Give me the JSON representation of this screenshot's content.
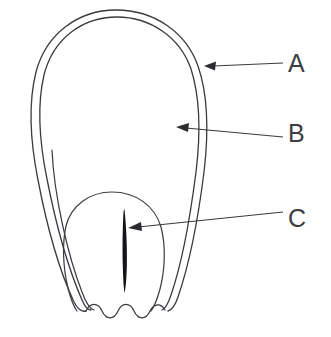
{
  "figure": {
    "kind": "botanical-line-diagram",
    "background_color": "#ffffff",
    "line_color": "#3a3a40",
    "fill_color": "#141418",
    "text_color": "#3d3d42",
    "width": 331,
    "height": 337,
    "parts": {
      "outer_wall_outer_name": "outer-wall-outer-contour",
      "outer_wall_inner_name": "outer-wall-inner-contour",
      "inner_body_name": "inner-body-contour",
      "dark_blade_name": "dark-blade-shape",
      "wavy_base_name": "wavy-base-edge"
    }
  },
  "labels": [
    {
      "id": "A",
      "text": "A",
      "text_x": 288,
      "text_y": 72,
      "leader": {
        "x1": 283,
        "y1": 63,
        "x2": 212,
        "y2": 66
      },
      "arrow_tip": {
        "x": 204,
        "y": 66
      },
      "target": "outer-wall-outer-contour"
    },
    {
      "id": "B",
      "text": "B",
      "text_x": 288,
      "text_y": 142,
      "leader": {
        "x1": 283,
        "y1": 137,
        "x2": 185,
        "y2": 128
      },
      "arrow_tip": {
        "x": 176,
        "y": 127
      },
      "target": "inner-region"
    },
    {
      "id": "C",
      "text": "C",
      "text_x": 288,
      "text_y": 227,
      "leader": {
        "x1": 283,
        "y1": 212,
        "x2": 137,
        "y2": 227
      },
      "arrow_tip": {
        "x": 128,
        "y": 228
      },
      "target": "dark-blade-shape"
    }
  ]
}
